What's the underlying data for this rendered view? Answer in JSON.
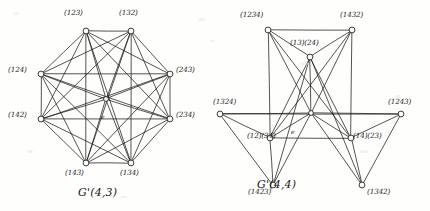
{
  "figure": {
    "background_color": "#fefefd",
    "ink_color": "#1b1b1b",
    "panels": [
      {
        "id": "left",
        "caption": "G'(4,3)",
        "caption_x": 78,
        "caption_y": 186,
        "center_label": "e",
        "center_label_x": 101,
        "center_label_y": 113,
        "nodes": [
          {
            "name": "node-123",
            "label": "(123)",
            "cx": 86,
            "cy": 31,
            "lx": 64,
            "ly": 9
          },
          {
            "name": "node-132",
            "label": "(132)",
            "cx": 131,
            "cy": 31,
            "lx": 119,
            "ly": 9
          },
          {
            "name": "node-124",
            "label": "(124)",
            "cx": 41,
            "cy": 74,
            "lx": 8,
            "ly": 66
          },
          {
            "name": "node-243",
            "label": "(243)",
            "cx": 170,
            "cy": 74,
            "lx": 176,
            "ly": 66
          },
          {
            "name": "node-142",
            "label": "(142)",
            "cx": 41,
            "cy": 119,
            "lx": 8,
            "ly": 111
          },
          {
            "name": "node-234",
            "label": "(234)",
            "cx": 170,
            "cy": 119,
            "lx": 176,
            "ly": 111
          },
          {
            "name": "node-143",
            "label": "(143)",
            "cx": 86,
            "cy": 163,
            "lx": 65,
            "ly": 169
          },
          {
            "name": "node-134",
            "label": "(134)",
            "cx": 131,
            "cy": 163,
            "lx": 120,
            "ly": 169
          },
          {
            "name": "node-e",
            "label": "",
            "cx": 106,
            "cy": 99,
            "lx": 0,
            "ly": 0
          }
        ],
        "edges": [
          [
            0,
            1
          ],
          [
            0,
            2
          ],
          [
            1,
            3
          ],
          [
            2,
            4
          ],
          [
            3,
            5
          ],
          [
            4,
            6
          ],
          [
            5,
            7
          ],
          [
            6,
            7
          ],
          [
            0,
            3
          ],
          [
            0,
            4
          ],
          [
            0,
            5
          ],
          [
            0,
            6
          ],
          [
            0,
            7
          ],
          [
            1,
            2
          ],
          [
            1,
            4
          ],
          [
            1,
            5
          ],
          [
            1,
            6
          ],
          [
            1,
            7
          ],
          [
            2,
            3
          ],
          [
            2,
            5
          ],
          [
            2,
            6
          ],
          [
            2,
            7
          ],
          [
            3,
            4
          ],
          [
            3,
            6
          ],
          [
            3,
            7
          ],
          [
            4,
            5
          ],
          [
            4,
            7
          ],
          [
            5,
            6
          ],
          [
            8,
            0
          ],
          [
            8,
            1
          ],
          [
            8,
            2
          ],
          [
            8,
            3
          ],
          [
            8,
            4
          ],
          [
            8,
            5
          ],
          [
            8,
            6
          ],
          [
            8,
            7
          ]
        ]
      },
      {
        "id": "right",
        "caption": "G'(4,4)",
        "caption_x": 42,
        "caption_y": 178,
        "center_label": "e",
        "center_label_x": 76,
        "center_label_y": 128,
        "nodes": [
          {
            "name": "node-1234",
            "label": "(1234)",
            "cx": 53,
            "cy": 30,
            "lx": 25,
            "ly": 11
          },
          {
            "name": "node-1432",
            "label": "(1432)",
            "cx": 137,
            "cy": 30,
            "lx": 125,
            "ly": 11
          },
          {
            "name": "node-13-24",
            "label": "(13)(24)",
            "cx": 95,
            "cy": 57,
            "lx": 75,
            "ly": 39
          },
          {
            "name": "node-1324",
            "label": "(1324)",
            "cx": 5,
            "cy": 114,
            "lx": -2,
            "ly": 98
          },
          {
            "name": "node-1243",
            "label": "(1243)",
            "cx": 186,
            "cy": 114,
            "lx": 173,
            "ly": 98
          },
          {
            "name": "node-12-34",
            "label": "(12)(34)",
            "cx": 55,
            "cy": 138,
            "lx": 32,
            "ly": 132
          },
          {
            "name": "node-14-23",
            "label": "(14)(23)",
            "cx": 136,
            "cy": 138,
            "lx": 138,
            "ly": 132
          },
          {
            "name": "node-1423",
            "label": "(1423)",
            "cx": 58,
            "cy": 185,
            "lx": 33,
            "ly": 188
          },
          {
            "name": "node-1342",
            "label": "(1342)",
            "cx": 147,
            "cy": 185,
            "lx": 152,
            "ly": 188
          },
          {
            "name": "node-e",
            "label": "",
            "cx": 96,
            "cy": 113,
            "lx": 0,
            "ly": 0
          }
        ],
        "edges": [
          [
            0,
            1
          ],
          [
            0,
            2
          ],
          [
            1,
            2
          ],
          [
            0,
            5
          ],
          [
            0,
            9
          ],
          [
            0,
            6
          ],
          [
            1,
            6
          ],
          [
            1,
            9
          ],
          [
            1,
            5
          ],
          [
            2,
            9
          ],
          [
            2,
            5
          ],
          [
            2,
            6
          ],
          [
            2,
            7
          ],
          [
            2,
            8
          ],
          [
            3,
            5
          ],
          [
            3,
            7
          ],
          [
            3,
            9
          ],
          [
            4,
            6
          ],
          [
            4,
            8
          ],
          [
            4,
            9
          ],
          [
            5,
            7
          ],
          [
            5,
            9
          ],
          [
            5,
            6
          ],
          [
            6,
            8
          ],
          [
            6,
            9
          ],
          [
            7,
            9
          ],
          [
            8,
            9
          ],
          [
            3,
            4
          ]
        ]
      }
    ]
  }
}
